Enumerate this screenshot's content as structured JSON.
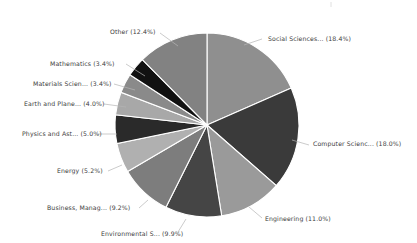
{
  "chart_data": {
    "type": "pie",
    "title": "",
    "subtitle": "",
    "xlabel": "",
    "ylabel": "",
    "legend_position": "none",
    "grid": false,
    "label_format": "{name} ({value}%)",
    "start_angle_deg": 0,
    "direction": "clockwise",
    "categories": [
      "Social Sciences...",
      "Computer Scienc...",
      "Engineering",
      "Environmental S...",
      "Business, Manag...",
      "Energy",
      "Physics and Ast...",
      "Earth and Plane...",
      "Materials Scien...",
      "Mathematics",
      "Other"
    ],
    "values": [
      18.4,
      18.0,
      11.0,
      9.9,
      9.2,
      5.2,
      5.0,
      4.0,
      3.4,
      3.4,
      12.4
    ],
    "colors": [
      "#8f8f8f",
      "#3a3a3a",
      "#9a9a9a",
      "#454545",
      "#7d7d7d",
      "#b0b0b0",
      "#2a2a2a",
      "#a8a8a8",
      "#8a8a8a",
      "#111111",
      "#828282"
    ],
    "labels": [
      "Social Sciences... (18.4%)",
      "Computer Scienc... (18.0%)",
      "Engineering (11.0%)",
      "Environmental S... (9.9%)",
      "Business, Manag... (9.2%)",
      "Energy (5.2%)",
      "Physics and Ast... (5.0%)",
      "Earth and Plane... (4.0%)",
      "Materials Scien... (3.4%)",
      "Mathematics (3.4%)",
      "Other (12.4%)"
    ],
    "slices": [
      {
        "name": "Social Sciences...",
        "value": 18.4,
        "label": "Social Sciences... (18.4%)",
        "color": "#8f8f8f",
        "label_x": 268,
        "label_y": 41,
        "anchor": "start",
        "leader": [
          [
            244,
            45
          ],
          [
            262,
            39
          ]
        ]
      },
      {
        "name": "Computer Scienc...",
        "value": 18.0,
        "label": "Computer Scienc... (18.0%)",
        "color": "#3a3a3a",
        "label_x": 313,
        "label_y": 146,
        "anchor": "start",
        "leader": [
          [
            292,
            140
          ],
          [
            309,
            145
          ]
        ]
      },
      {
        "name": "Engineering",
        "value": 11.0,
        "label": "Engineering (11.0%)",
        "color": "#9a9a9a",
        "label_x": 265,
        "label_y": 221,
        "anchor": "start",
        "leader": [
          [
            249,
            207
          ],
          [
            262,
            218
          ]
        ]
      },
      {
        "name": "Environmental S...",
        "value": 9.9,
        "label": "Environmental S... (9.9%)",
        "color": "#454545",
        "label_x": 101,
        "label_y": 236,
        "anchor": "start",
        "leader": [
          [
            186,
            219
          ],
          [
            178,
            232
          ]
        ]
      },
      {
        "name": "Business, Manag...",
        "value": 9.2,
        "label": "Business, Manag... (9.2%)",
        "color": "#7d7d7d",
        "label_x": 47,
        "label_y": 210,
        "anchor": "start",
        "leader": [
          [
            148,
            200
          ],
          [
            139,
            208
          ]
        ]
      },
      {
        "name": "Energy",
        "value": 5.2,
        "label": "Energy (5.2%)",
        "color": "#b0b0b0",
        "label_x": 57,
        "label_y": 173,
        "anchor": "start",
        "leader": [
          [
            122,
            165
          ],
          [
            108,
            171
          ]
        ]
      },
      {
        "name": "Physics and Ast...",
        "value": 5.0,
        "label": "Physics and Ast... (5.0%)",
        "color": "#2a2a2a",
        "label_x": 22,
        "label_y": 136,
        "anchor": "start",
        "leader": [
          [
            117,
            134
          ],
          [
            97,
            134
          ]
        ]
      },
      {
        "name": "Earth and Plane...",
        "value": 4.0,
        "label": "Earth and Plane... (4.0%)",
        "color": "#a8a8a8",
        "label_x": 24,
        "label_y": 106,
        "anchor": "start",
        "leader": [
          [
            126,
            107
          ],
          [
            104,
            104
          ]
        ]
      },
      {
        "name": "Materials Scien...",
        "value": 3.4,
        "label": "Materials Scien... (3.4%)",
        "color": "#8a8a8a",
        "label_x": 33,
        "label_y": 86,
        "anchor": "start",
        "leader": [
          [
            135,
            90
          ],
          [
            114,
            84
          ]
        ]
      },
      {
        "name": "Mathematics",
        "value": 3.4,
        "label": "Mathematics (3.4%)",
        "color": "#111111",
        "label_x": 50,
        "label_y": 66,
        "anchor": "start",
        "leader": [
          [
            145,
            76
          ],
          [
            126,
            64
          ]
        ]
      },
      {
        "name": "Other",
        "value": 12.4,
        "label": "Other (12.4%)",
        "color": "#828282",
        "label_x": 110,
        "label_y": 34,
        "anchor": "start",
        "leader": [
          [
            178,
            46
          ],
          [
            160,
            33
          ]
        ]
      }
    ]
  },
  "figure": {
    "center_x": 207,
    "center_y": 125,
    "radius": 92,
    "background": "#ffffff",
    "text_color": "#3c3c3c",
    "leader_color": "#b4b4b4",
    "slice_border": "#ffffff"
  }
}
